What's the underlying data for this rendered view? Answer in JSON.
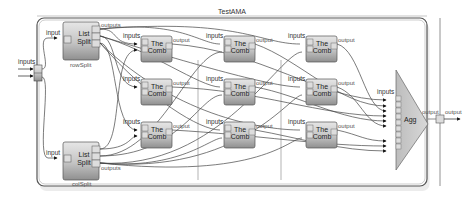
{
  "diagram": {
    "title": "TestAMA",
    "outer_inputs_label": "inputs",
    "outer_output_label": "output",
    "list_splits": [
      {
        "id": "rowSplit",
        "name": "rowSplit",
        "line1": "List",
        "line2": "Split",
        "in_label": "input",
        "out_label": "outputs"
      },
      {
        "id": "colSplit",
        "name": "colSplit",
        "line1": "List",
        "line2": "Split",
        "in_label": "input",
        "out_label": "outputs"
      }
    ],
    "combiners": [
      {
        "line1": "The",
        "line2": "Comb",
        "in_label": "inputs",
        "out_label": "output"
      },
      {
        "line1": "The",
        "line2": "Comb",
        "in_label": "inputs",
        "out_label": "output"
      },
      {
        "line1": "The",
        "line2": "Comb",
        "in_label": "inputs",
        "out_label": "output"
      },
      {
        "line1": "The",
        "line2": "Comb",
        "in_label": "inputs",
        "out_label": "output"
      },
      {
        "line1": "The",
        "line2": "Comb",
        "in_label": "inputs",
        "out_label": "output"
      },
      {
        "line1": "The",
        "line2": "Comb",
        "in_label": "inputs",
        "out_label": "output"
      },
      {
        "line1": "The",
        "line2": "Comb",
        "in_label": "inputs",
        "out_label": "output"
      },
      {
        "line1": "The",
        "line2": "Comb",
        "in_label": "inputs",
        "out_label": "output"
      },
      {
        "line1": "The",
        "line2": "Comb",
        "in_label": "inputs",
        "out_label": "output"
      }
    ],
    "aggregator": {
      "label": "Agg",
      "in_label": "inputs",
      "out_label": "output",
      "input_ports": 9
    }
  }
}
